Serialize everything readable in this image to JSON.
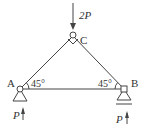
{
  "diagram": {
    "type": "truss",
    "nodes": {
      "A": {
        "label": "A",
        "support": "pin"
      },
      "B": {
        "label": "B",
        "support": "roller"
      },
      "C": {
        "label": "C",
        "support": "none"
      }
    },
    "members": [
      "AC",
      "CB",
      "AB"
    ],
    "load": {
      "node": "C",
      "label": "2P",
      "direction": "down"
    },
    "reactions": {
      "A": {
        "label": "P",
        "direction": "up"
      },
      "B": {
        "label": "P",
        "direction": "up"
      }
    },
    "angles": {
      "A": "45°",
      "B": "45°"
    },
    "colors": {
      "line": "#444444",
      "text": "#333333",
      "background": "#ffffff"
    }
  }
}
